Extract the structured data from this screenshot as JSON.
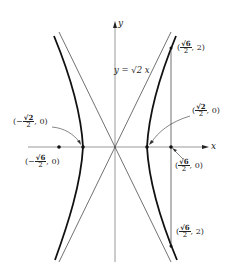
{
  "axes": {
    "x_label": "x",
    "y_label": "y"
  },
  "asymptote_label": "y = √2 x",
  "points": {
    "top_right": {
      "open": "(",
      "num": "√6",
      "den": "2",
      "rest": ", 2)"
    },
    "right_vertex": {
      "open": "(",
      "num": "√2",
      "den": "2",
      "rest": ", 0)"
    },
    "left_vertex": {
      "open": "(−",
      "num": "√2",
      "den": "2",
      "rest": ", 0)"
    },
    "left_focus": {
      "open": "(−",
      "num": "√6",
      "den": "2",
      "rest": ", 0)"
    },
    "right_focus": {
      "open": "(",
      "num": "√6",
      "den": "2",
      "rest": ", 0)"
    },
    "bottom_right": {
      "open": "(",
      "num": "√6",
      "den": "2",
      "rest": ", 2)"
    }
  },
  "colors": {
    "curve": "#111111",
    "axis": "#444444",
    "text": "#222222"
  }
}
